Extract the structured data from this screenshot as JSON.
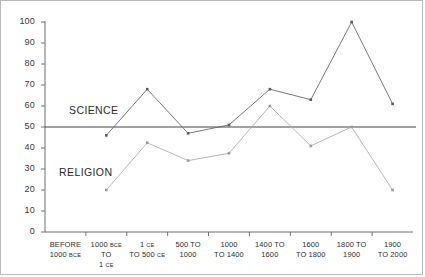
{
  "chart_data": {
    "type": "line",
    "title": "",
    "xlabel": "",
    "ylabel": "",
    "ylim": [
      0,
      100
    ],
    "ytick_values": [
      0,
      10,
      20,
      30,
      40,
      50,
      60,
      70,
      80,
      90,
      100
    ],
    "ytick_labels": [
      "0",
      "10",
      "20",
      "30",
      "40",
      "50",
      "60",
      "70",
      "80",
      "90",
      "100"
    ],
    "grid": false,
    "legend": "inline-annotations",
    "reference_line": {
      "value": 50,
      "color": "#444444"
    },
    "categories": [
      "BEFORE 1000 BCE",
      "1000 BCE TO 1 CE",
      "1 CE TO 500 CE",
      "500 TO 1000",
      "1000 TO 1400",
      "1400 TO 1600",
      "1600 TO 1800",
      "1800 TO 1900",
      "1900 TO 2000"
    ],
    "categories_display": [
      {
        "line1": "BEFORE",
        "line2_pre": "1000 ",
        "line2_sc": "BCE",
        "line2_post": "",
        "line1_sc": "",
        "line1_post": ""
      },
      {
        "line1_pre": "1000 ",
        "line1_sc": "BCE",
        "line1_post": " TO",
        "line2_pre": "1 ",
        "line2_sc": "CE",
        "line2_post": ""
      },
      {
        "line1_pre": "1 ",
        "line1_sc": "CE",
        "line1_post": "",
        "line2_pre": "TO 500 ",
        "line2_sc": "CE",
        "line2_post": ""
      },
      {
        "line1_pre": "500 TO",
        "line1_sc": "",
        "line1_post": "",
        "line2_pre": "1000",
        "line2_sc": "",
        "line2_post": ""
      },
      {
        "line1_pre": "1000",
        "line1_sc": "",
        "line1_post": "",
        "line2_pre": "TO 1400",
        "line2_sc": "",
        "line2_post": ""
      },
      {
        "line1_pre": "1400 TO",
        "line1_sc": "",
        "line1_post": "",
        "line2_pre": "1600",
        "line2_sc": "",
        "line2_post": ""
      },
      {
        "line1_pre": "1600",
        "line1_sc": "",
        "line1_post": "",
        "line2_pre": "TO 1800",
        "line2_sc": "",
        "line2_post": ""
      },
      {
        "line1_pre": "1800 TO",
        "line1_sc": "",
        "line1_post": "",
        "line2_pre": "1900",
        "line2_sc": "",
        "line2_post": ""
      },
      {
        "line1_pre": "1900",
        "line1_sc": "",
        "line1_post": "",
        "line2_pre": "TO 2000",
        "line2_sc": "",
        "line2_post": ""
      }
    ],
    "series": [
      {
        "name": "SCIENCE",
        "color": "#6b6b6b",
        "values": [
          46,
          68,
          47,
          51,
          68,
          63,
          100,
          61,
          null
        ],
        "start_index": 1
      },
      {
        "name": "RELIGION",
        "color": "#b0b0b0",
        "values": [
          20,
          42.5,
          34,
          37.5,
          60,
          41,
          50,
          20,
          null
        ],
        "start_index": 1
      }
    ],
    "annotations": [
      {
        "text": "SCIENCE",
        "x_px": 68,
        "y_px": 103
      },
      {
        "text": "RELIGION",
        "x_px": 58,
        "y_px": 165
      }
    ]
  }
}
